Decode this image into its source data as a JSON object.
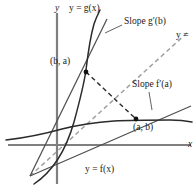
{
  "figure": {
    "type": "math-diagram",
    "background_color": "#ffffff",
    "width": 195,
    "height": 186
  },
  "axes": {
    "x_label": "x",
    "y_label": "y",
    "color": "#7a7a7a",
    "origin": {
      "x": 57,
      "y": 145
    },
    "x_axis_end": {
      "x": 190,
      "y": 145
    },
    "y_axis_top": {
      "x": 57,
      "y": 14
    }
  },
  "curves": [
    {
      "name": "g-curve",
      "label": "y = g(x)",
      "label_plain": "y = g(x)",
      "color": "#2b2b2b",
      "style": "solid"
    },
    {
      "name": "f-curve",
      "label": "y = f(x)",
      "label_plain": "y = f(x)",
      "color": "#2b2b2b",
      "style": "solid"
    }
  ],
  "lines": [
    {
      "name": "identity-line",
      "label": "y =",
      "label_note": "label cropped at right edge of image",
      "color": "#9a9a9a",
      "style": "dashed"
    },
    {
      "name": "tangent-g",
      "label": "Slope g′(b)",
      "color": "#4a4a4a",
      "style": "solid"
    },
    {
      "name": "tangent-f",
      "label": "Slope f′(a)",
      "color": "#4a4a4a",
      "style": "solid"
    },
    {
      "name": "reflection-connector",
      "color": "#2b2b2b",
      "style": "dashed"
    }
  ],
  "points": [
    {
      "name": "point-b-a",
      "label": "(b, a)",
      "on_curve": "y = g(x)",
      "pixel": {
        "x": 85,
        "y": 72
      }
    },
    {
      "name": "point-a-b",
      "label": "(a, b)",
      "on_curve": "y = f(x)",
      "pixel": {
        "x": 136,
        "y": 119
      }
    }
  ],
  "annotations": {
    "slope_g_label": "Slope g′(b)",
    "slope_f_label": "Slope f′(a)",
    "identity_label": "y =",
    "g_curve_label": "y = g(x)",
    "f_curve_label": "y = f(x)",
    "point_ba_label": "(b, a)",
    "point_ab_label": "(a, b)",
    "x_axis_label": "x",
    "y_axis_label": "y"
  }
}
